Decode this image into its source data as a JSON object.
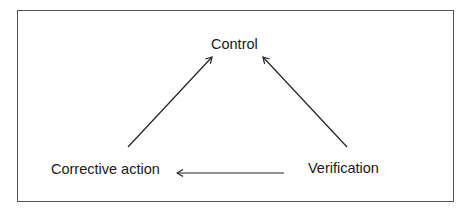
{
  "diagram": {
    "nodes": [
      {
        "id": "control",
        "label": "Control"
      },
      {
        "id": "corrective_action",
        "label": "Corrective action"
      },
      {
        "id": "verification",
        "label": "Verification"
      }
    ],
    "edges": [
      {
        "from": "corrective_action",
        "to": "control"
      },
      {
        "from": "verification",
        "to": "control"
      },
      {
        "from": "verification",
        "to": "corrective_action"
      }
    ],
    "colors": {
      "line": "#222222",
      "border": "#555555",
      "background": "#ffffff"
    }
  }
}
